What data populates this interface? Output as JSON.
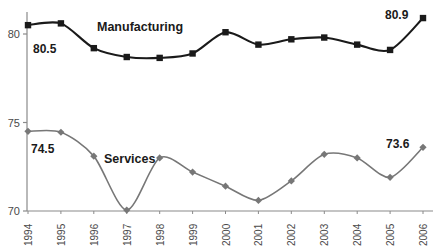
{
  "chart_data": {
    "type": "line",
    "title": "",
    "subtitle": "",
    "xlabel": "",
    "ylabel": "",
    "categories": [
      "1994",
      "1995",
      "1996",
      "1997",
      "1998",
      "1999",
      "2000",
      "2001",
      "2002",
      "2003",
      "2004",
      "2005",
      "2006"
    ],
    "x": [
      1994,
      1995,
      1996,
      1997,
      1998,
      1999,
      2000,
      2001,
      2002,
      2003,
      2004,
      2005,
      2006
    ],
    "ylim": [
      70,
      81.3
    ],
    "yticks": [
      70,
      75,
      80
    ],
    "ytick_labels": [
      "70",
      "75",
      "80"
    ],
    "grid": false,
    "legend_position": "inline-annotation",
    "series": [
      {
        "name": "Manufacturing",
        "color": "#1a1a1a",
        "marker": "square",
        "values": [
          80.5,
          80.6,
          79.2,
          78.7,
          78.65,
          78.9,
          80.1,
          79.4,
          79.7,
          79.8,
          79.4,
          79.1,
          80.9
        ]
      },
      {
        "name": "Services",
        "color": "#777777",
        "marker": "diamond",
        "values": [
          74.5,
          74.45,
          73.1,
          70.05,
          73.0,
          72.2,
          71.4,
          70.6,
          71.7,
          73.2,
          73.0,
          71.9,
          73.6
        ]
      }
    ],
    "annotations": [
      {
        "id": "manufacturing-series-name",
        "text": "Manufacturing"
      },
      {
        "id": "services-series-name",
        "text": "Services"
      },
      {
        "id": "manufacturing-start-value",
        "text": "80.5"
      },
      {
        "id": "manufacturing-end-value",
        "text": "80.9"
      },
      {
        "id": "services-start-value",
        "text": "74.5"
      },
      {
        "id": "services-end-value",
        "text": "73.6"
      }
    ]
  },
  "axis": {
    "y_labels": [
      "80",
      "75",
      "70"
    ],
    "x_labels": [
      "1994",
      "1995",
      "1996",
      "1997",
      "1998",
      "1999",
      "2000",
      "2001",
      "2002",
      "2003",
      "2004",
      "2005",
      "2006"
    ]
  },
  "colors": {
    "manufacturing": "#1a1a1a",
    "services": "#777777",
    "axis": "#8a8a8a",
    "text": "#4a4a4a",
    "background": "#ffffff"
  }
}
